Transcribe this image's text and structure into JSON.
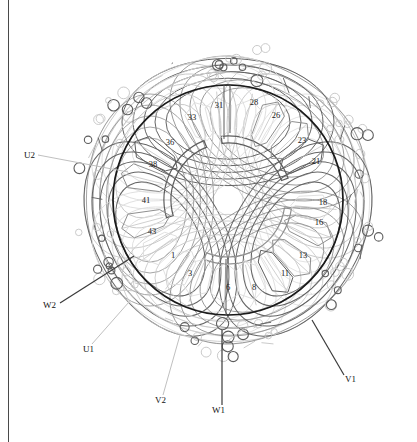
{
  "figure": {
    "type": "toroidal-winding-stator-cross-section"
  },
  "geometry": {
    "center_x": 228,
    "center_y": 200,
    "stator_outer_radius": 115,
    "bore_inner_radius": 57,
    "toroid_loop_count": 12,
    "toroid_outer_radius": 155
  },
  "colors": {
    "stator_circle": "#1a1a1a",
    "winding_dark": "#5d5d5d",
    "winding_mid": "#8f8f8f",
    "winding_light": "#c4c4c4",
    "winding_faint": "#dcdcdc",
    "label_text": "#111111",
    "leader_dark": "#3a3a3a",
    "leader_light": "#c0c0c0",
    "frame_line": "#4a4a4a",
    "background": "#ffffff"
  },
  "slot_numbers": [
    {
      "id": "slot-33",
      "label": "33",
      "x": 192,
      "y": 120,
      "angle_deg": 109
    },
    {
      "id": "slot-31",
      "label": "31",
      "x": 219,
      "y": 108,
      "angle_deg": 96
    },
    {
      "id": "slot-28",
      "label": "28",
      "x": 254,
      "y": 105,
      "angle_deg": 77
    },
    {
      "id": "slot-26",
      "label": "26",
      "x": 276,
      "y": 118,
      "angle_deg": 63
    },
    {
      "id": "slot-23",
      "label": "23",
      "x": 302,
      "y": 143,
      "angle_deg": 44
    },
    {
      "id": "slot-21",
      "label": "21",
      "x": 316,
      "y": 164,
      "angle_deg": 30
    },
    {
      "id": "slot-18",
      "label": "18",
      "x": 323,
      "y": 205,
      "angle_deg": 355
    },
    {
      "id": "slot-16",
      "label": "16",
      "x": 319,
      "y": 225,
      "angle_deg": 340
    },
    {
      "id": "slot-13",
      "label": "13",
      "x": 303,
      "y": 258,
      "angle_deg": 318
    },
    {
      "id": "slot-11",
      "label": "11",
      "x": 285,
      "y": 276,
      "angle_deg": 303
    },
    {
      "id": "slot-8",
      "label": "8",
      "x": 254,
      "y": 290,
      "angle_deg": 285
    },
    {
      "id": "slot-6",
      "label": "6",
      "x": 228,
      "y": 290,
      "angle_deg": 268
    },
    {
      "id": "slot-3",
      "label": "3",
      "x": 190,
      "y": 276,
      "angle_deg": 249
    },
    {
      "id": "slot-1",
      "label": "1",
      "x": 173,
      "y": 258,
      "angle_deg": 235
    },
    {
      "id": "slot-43",
      "label": "43",
      "x": 152,
      "y": 234,
      "angle_deg": 215
    },
    {
      "id": "slot-41",
      "label": "41",
      "x": 146,
      "y": 203,
      "angle_deg": 195
    },
    {
      "id": "slot-38",
      "label": "38",
      "x": 153,
      "y": 167,
      "angle_deg": 166
    },
    {
      "id": "slot-36",
      "label": "36",
      "x": 170,
      "y": 145,
      "angle_deg": 148
    }
  ],
  "terminals": [
    {
      "id": "terminal-u2",
      "label": "U2",
      "text_x": 24,
      "text_y": 158,
      "leader": {
        "x1": 38,
        "y1": 155,
        "x2": 128,
        "y2": 172
      },
      "leader_tone": "light"
    },
    {
      "id": "terminal-w2",
      "label": "W2",
      "text_x": 43,
      "text_y": 308,
      "leader": {
        "x1": 60,
        "y1": 303,
        "x2": 134,
        "y2": 256
      },
      "leader_tone": "dark"
    },
    {
      "id": "terminal-u1",
      "label": "U1",
      "text_x": 83,
      "text_y": 352,
      "leader": {
        "x1": 92,
        "y1": 344,
        "x2": 129,
        "y2": 302
      },
      "leader_tone": "light"
    },
    {
      "id": "terminal-v2",
      "label": "V2",
      "text_x": 155,
      "text_y": 403,
      "leader": {
        "x1": 163,
        "y1": 395,
        "x2": 180,
        "y2": 335
      },
      "leader_tone": "light"
    },
    {
      "id": "terminal-w1",
      "label": "W1",
      "text_x": 212,
      "text_y": 413,
      "leader": {
        "x1": 222,
        "y1": 405,
        "x2": 222,
        "y2": 330
      },
      "leader_tone": "dark"
    },
    {
      "id": "terminal-v1",
      "label": "V1",
      "text_x": 345,
      "text_y": 382,
      "leader": {
        "x1": 344,
        "y1": 375,
        "x2": 312,
        "y2": 320
      },
      "leader_tone": "dark"
    }
  ]
}
